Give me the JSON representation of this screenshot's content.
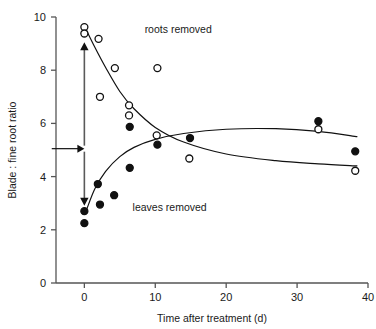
{
  "chart_data": {
    "type": "scatter",
    "title": "",
    "xlabel": "Time after treatment (d)",
    "ylabel": "Blade : fine root ratio",
    "xlim": [
      -4,
      40
    ],
    "ylim": [
      0,
      10
    ],
    "xticks": [
      0,
      10,
      20,
      30,
      40
    ],
    "yticks": [
      0,
      2,
      4,
      6,
      8,
      10
    ],
    "grid": false,
    "legend_position": "inline-annotation",
    "series": [
      {
        "name": "roots removed",
        "marker": "open-circle",
        "points": [
          {
            "x": 0.0,
            "y": 9.62
          },
          {
            "x": 0.0,
            "y": 9.38
          },
          {
            "x": 2.0,
            "y": 9.18
          },
          {
            "x": 4.3,
            "y": 8.08
          },
          {
            "x": 10.3,
            "y": 8.08
          },
          {
            "x": 2.2,
            "y": 7.0
          },
          {
            "x": 6.3,
            "y": 6.68
          },
          {
            "x": 6.3,
            "y": 6.3
          },
          {
            "x": 10.2,
            "y": 5.55
          },
          {
            "x": 14.8,
            "y": 4.68
          },
          {
            "x": 33.0,
            "y": 5.78
          },
          {
            "x": 38.2,
            "y": 4.22
          }
        ]
      },
      {
        "name": "leaves removed",
        "marker": "filled-circle",
        "points": [
          {
            "x": 0.0,
            "y": 2.7
          },
          {
            "x": 0.0,
            "y": 2.25
          },
          {
            "x": 1.9,
            "y": 3.72
          },
          {
            "x": 2.2,
            "y": 2.95
          },
          {
            "x": 4.2,
            "y": 3.3
          },
          {
            "x": 6.4,
            "y": 4.33
          },
          {
            "x": 6.4,
            "y": 5.87
          },
          {
            "x": 10.3,
            "y": 5.2
          },
          {
            "x": 14.9,
            "y": 5.45
          },
          {
            "x": 33.0,
            "y": 6.08
          },
          {
            "x": 38.2,
            "y": 4.95
          }
        ]
      }
    ],
    "fitted_curves": [
      {
        "name": "roots-removed-curve",
        "points": [
          {
            "x": 0.2,
            "y": 9.55
          },
          {
            "x": 1.5,
            "y": 8.85
          },
          {
            "x": 3.0,
            "y": 8.1
          },
          {
            "x": 5.0,
            "y": 7.2
          },
          {
            "x": 7.0,
            "y": 6.55
          },
          {
            "x": 10.0,
            "y": 5.85
          },
          {
            "x": 14.0,
            "y": 5.3
          },
          {
            "x": 20.0,
            "y": 4.85
          },
          {
            "x": 27.0,
            "y": 4.6
          },
          {
            "x": 33.0,
            "y": 4.48
          },
          {
            "x": 38.5,
            "y": 4.4
          }
        ]
      },
      {
        "name": "leaves-removed-curve",
        "points": [
          {
            "x": 0.3,
            "y": 2.75
          },
          {
            "x": 1.5,
            "y": 3.55
          },
          {
            "x": 3.0,
            "y": 4.2
          },
          {
            "x": 5.0,
            "y": 4.75
          },
          {
            "x": 7.0,
            "y": 5.1
          },
          {
            "x": 10.0,
            "y": 5.4
          },
          {
            "x": 14.0,
            "y": 5.62
          },
          {
            "x": 20.0,
            "y": 5.78
          },
          {
            "x": 27.0,
            "y": 5.8
          },
          {
            "x": 33.0,
            "y": 5.7
          },
          {
            "x": 38.5,
            "y": 5.5
          }
        ]
      }
    ],
    "annotations": [
      {
        "name": "roots-removed-label",
        "text": "roots removed",
        "x": 8.5,
        "y": 9.55
      },
      {
        "name": "leaves-removed-label",
        "text": "leaves removed",
        "x": 6.8,
        "y": 2.85
      }
    ],
    "arrows": [
      {
        "name": "vertical-divergence-arrow",
        "x": 0.0,
        "y_from": 5.05,
        "y_to_top": 9.05,
        "y_to_bottom": 2.9,
        "style": "double-headed-dashed"
      },
      {
        "name": "control-level-arrow",
        "y": 5.05,
        "x_from": -4.6,
        "x_to": 0.0,
        "style": "single-headed"
      }
    ],
    "colors": {
      "axis": "#555555",
      "marker_fill": "#111111",
      "marker_stroke": "#111111",
      "curve": "#111111",
      "text": "#1a1a1a",
      "arrow": "#5a5a5a",
      "background": "#ffffff"
    }
  }
}
